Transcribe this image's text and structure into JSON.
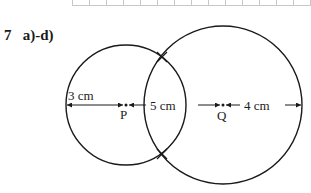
{
  "problem": {
    "number": "7",
    "parts": "a)-d)"
  },
  "figure": {
    "colors": {
      "stroke": "#1a1a1a",
      "grid": "#c8c8c8",
      "text": "#222222"
    },
    "points": [
      {
        "name": "P",
        "label": "P"
      },
      {
        "name": "Q",
        "label": "Q"
      }
    ],
    "measurements": {
      "left_radius": "3 cm",
      "pq_distance": "5 cm",
      "right_radius": "4 cm"
    }
  }
}
